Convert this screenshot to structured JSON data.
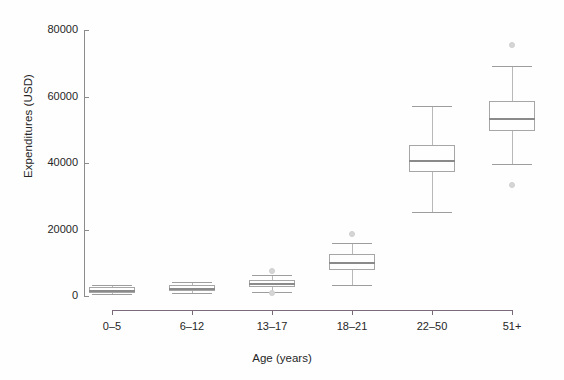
{
  "chart_data": {
    "type": "box",
    "title": "",
    "xlabel": "Age (years)",
    "ylabel": "Expenditures (USD)",
    "categories": [
      "0–5",
      "6–12",
      "13–17",
      "18–21",
      "22–50",
      "51+"
    ],
    "yticks": [
      0,
      20000,
      40000,
      60000,
      80000
    ],
    "ytick_labels": [
      "0",
      "20000",
      "40000",
      "60000",
      "80000"
    ],
    "ylim": [
      0,
      80000
    ],
    "grid": false,
    "legend": null,
    "boxes": [
      {
        "category": "0–5",
        "whisker_low": 600,
        "q1": 1000,
        "median": 1800,
        "q3": 2600,
        "whisker_high": 3200,
        "outliers": []
      },
      {
        "category": "6–12",
        "whisker_low": 800,
        "q1": 1400,
        "median": 2400,
        "q3": 3200,
        "whisker_high": 4200,
        "outliers": []
      },
      {
        "category": "13–17",
        "whisker_low": 1200,
        "q1": 2600,
        "median": 3800,
        "q3": 4800,
        "whisker_high": 6200,
        "outliers": [
          7400,
          1000
        ]
      },
      {
        "category": "18–21",
        "whisker_low": 3200,
        "q1": 7800,
        "median": 10200,
        "q3": 12600,
        "whisker_high": 15800,
        "outliers": [
          18600
        ]
      },
      {
        "category": "22–50",
        "whisker_low": 25400,
        "q1": 37200,
        "median": 40800,
        "q3": 45400,
        "whisker_high": 57000,
        "outliers": []
      },
      {
        "category": "51+",
        "whisker_low": 39800,
        "q1": 49600,
        "median": 53400,
        "q3": 58600,
        "whisker_high": 69200,
        "outliers": [
          75400,
          33400
        ]
      }
    ],
    "colors": {
      "box_edge": "#a6a6a6",
      "median": "#8a8a8a",
      "whisker": "#b8b8b8",
      "outlier": "#d6d6d6",
      "y_axis": "#8c8c8c",
      "x_axis": "#7a6a7a",
      "text": "#262626",
      "background": "#ffffff"
    }
  }
}
